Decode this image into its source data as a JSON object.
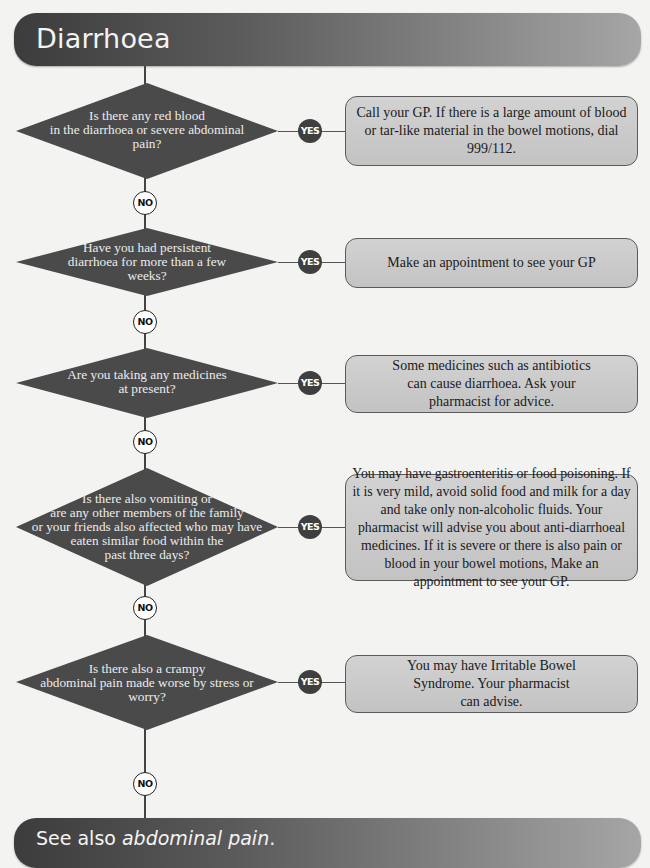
{
  "header": {
    "title": "Diarrhoea"
  },
  "footer": {
    "prefix": "See also ",
    "link": "abdominal pain",
    "suffix": "."
  },
  "labels": {
    "yes": "YES",
    "no": "NO"
  },
  "colors": {
    "diamond_fill": "#4a4a4a",
    "box_fill": "#c8c8c8",
    "yes_badge": "#3f3f3f",
    "line": "#444444"
  },
  "steps": [
    {
      "question_lines": [
        "Is there any red blood",
        "in the diarrhoea or severe  abdominal",
        "pain?"
      ],
      "answer": "Call your GP. If there is a large amount of blood or tar-like material in the bowel motions, dial 999/112."
    },
    {
      "question_lines": [
        "Have you had persistent",
        "diarrhoea for more than a few",
        "weeks?"
      ],
      "answer": "Make an appointment to see your GP"
    },
    {
      "question_lines": [
        "Are you taking any medicines",
        "at present?"
      ],
      "answer": "Some medicines such as antibiotics can cause diarrhoea. Ask your pharmacist for advice."
    },
    {
      "question_lines": [
        "Is there also vomiting or",
        "are any other members of the family",
        "or your friends also affected who may have",
        "eaten similar food within the",
        "past three days?"
      ],
      "answer": "You may have gastroenteritis or food poisoning. If it is very mild, avoid solid food and milk for a day and take only non-alcoholic fluids. Your pharmacist will advise you about anti-diarrhoeal medicines. If it is severe or there is also pain or blood in your bowel motions, Make an appointment to see your GP."
    },
    {
      "question_lines": [
        "Is there also a crampy",
        "abdominal pain made worse by stress or",
        "worry?"
      ],
      "answer": "You may have Irritable Bowel Syndrome. Your pharmacist can advise."
    }
  ]
}
